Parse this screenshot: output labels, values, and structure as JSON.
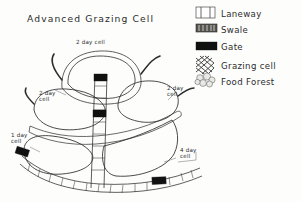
{
  "document": {
    "title": "Advanced Grazing Cell",
    "type": "hand-drawn permaculture grazing cell diagram",
    "background_color": "#fdfdfc",
    "ink_color": "#2b2b2b"
  },
  "legend": {
    "items": [
      {
        "icon": "laneway-swatch",
        "label": "Laneway",
        "swatch": "rectangle with vertical end bars",
        "color": "#ffffff"
      },
      {
        "icon": "swale-swatch",
        "label": "Swale",
        "swatch": "dark speckled band",
        "color": "#4a4a48"
      },
      {
        "icon": "gate-swatch",
        "label": "Gate",
        "swatch": "solid black bar",
        "color": "#111111"
      },
      {
        "icon": "grazing-cell-swatch",
        "label": "Grazing cell",
        "swatch": "cross-hatch mesh",
        "color": "#2e2e2e"
      },
      {
        "icon": "food-forest-swatch",
        "label": "Food Forest",
        "swatch": "cluster of round blobs",
        "color": "#e9e9e6"
      }
    ]
  },
  "diagram": {
    "cell_labels": [
      {
        "id": "top-cell",
        "text": "2 day cell",
        "lines": [
          "2 day cell"
        ],
        "x": 76,
        "y": 44
      },
      {
        "id": "left-cell",
        "text": "2 day cell",
        "lines": [
          "2 day",
          "cell"
        ],
        "x": 39,
        "y": 95
      },
      {
        "id": "right-cell",
        "text": "2 day cell",
        "lines": [
          "2 day",
          "cell"
        ],
        "x": 167,
        "y": 90
      },
      {
        "id": "bottom-left-cell",
        "text": "1 day cell",
        "lines": [
          "1 day",
          "cell"
        ],
        "x": 11,
        "y": 137
      },
      {
        "id": "bottom-right-cell",
        "text": "4 day cell",
        "lines": [
          "4 day",
          "cell"
        ],
        "x": 180,
        "y": 152
      }
    ],
    "gates": [
      {
        "id": "gate-top-lane",
        "x": 97,
        "y": 77
      },
      {
        "id": "gate-mid-lane",
        "x": 104,
        "y": 113
      },
      {
        "id": "gate-left-lower",
        "x": 22,
        "y": 151
      },
      {
        "id": "gate-bottom-lane",
        "x": 157,
        "y": 179
      }
    ],
    "feature_counts": {
      "grazing_cells": 5,
      "gates": 4,
      "laneways": 2,
      "swales": 3
    }
  }
}
